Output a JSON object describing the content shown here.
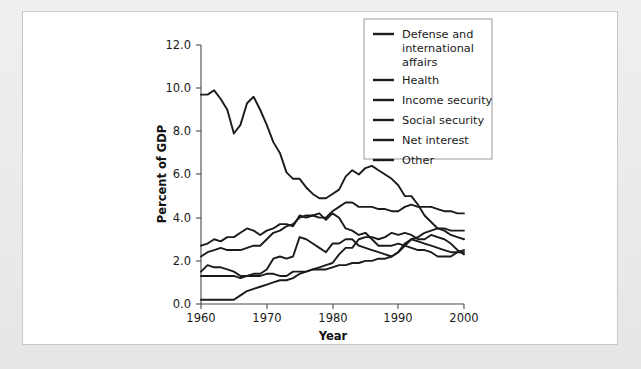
{
  "chart_data": {
    "type": "line",
    "title": "",
    "xlabel": "Year",
    "ylabel": "Percent of GDP",
    "xlim": [
      1960,
      2000
    ],
    "ylim": [
      0.0,
      12.0
    ],
    "grid": false,
    "legend_position": "top-right",
    "xticks": [
      1960,
      1970,
      1980,
      1990,
      2000
    ],
    "xtick_labels": [
      "1960",
      "1970",
      "1980",
      "1990",
      "2000"
    ],
    "yticks": [
      0.0,
      2.0,
      4.0,
      6.0,
      8.0,
      10.0,
      12.0
    ],
    "ytick_labels": [
      "0.0",
      "2.0",
      "4.0",
      "6.0",
      "8.0",
      "10.0",
      "12.0"
    ],
    "x": [
      1960,
      1961,
      1962,
      1963,
      1964,
      1965,
      1966,
      1967,
      1968,
      1969,
      1970,
      1971,
      1972,
      1973,
      1974,
      1975,
      1976,
      1977,
      1978,
      1979,
      1980,
      1981,
      1982,
      1983,
      1984,
      1985,
      1986,
      1987,
      1988,
      1989,
      1990,
      1991,
      1992,
      1993,
      1994,
      1995,
      1996,
      1997,
      1998,
      1999,
      2000
    ],
    "series": [
      {
        "name": "Defense and international affairs",
        "color": "#1b1b1b",
        "values": [
          9.7,
          9.7,
          9.9,
          9.5,
          9.0,
          7.9,
          8.3,
          9.3,
          9.6,
          9.0,
          8.3,
          7.5,
          7.0,
          6.1,
          5.8,
          5.8,
          5.4,
          5.1,
          4.9,
          4.9,
          5.1,
          5.3,
          5.9,
          6.2,
          6.0,
          6.3,
          6.4,
          6.2,
          6.0,
          5.8,
          5.5,
          5.0,
          5.0,
          4.6,
          4.1,
          3.8,
          3.5,
          3.4,
          3.2,
          3.1,
          3.0
        ]
      },
      {
        "name": "Health",
        "color": "#1b1b1b",
        "values": [
          0.2,
          0.2,
          0.2,
          0.2,
          0.2,
          0.2,
          0.4,
          0.6,
          0.7,
          0.8,
          0.9,
          1.0,
          1.1,
          1.1,
          1.2,
          1.4,
          1.5,
          1.6,
          1.6,
          1.6,
          1.7,
          1.8,
          1.8,
          1.9,
          1.9,
          2.0,
          2.0,
          2.1,
          2.1,
          2.2,
          2.4,
          2.7,
          3.0,
          3.1,
          3.3,
          3.4,
          3.5,
          3.5,
          3.4,
          3.4,
          3.4
        ]
      },
      {
        "name": "Income security",
        "color": "#1b1b1b",
        "values": [
          1.5,
          1.8,
          1.7,
          1.7,
          1.6,
          1.5,
          1.3,
          1.3,
          1.4,
          1.4,
          1.6,
          2.1,
          2.2,
          2.1,
          2.2,
          3.1,
          3.0,
          2.8,
          2.6,
          2.4,
          2.8,
          2.8,
          3.0,
          3.0,
          2.7,
          2.6,
          2.5,
          2.4,
          2.3,
          2.2,
          2.4,
          2.8,
          3.0,
          2.9,
          2.8,
          2.7,
          2.6,
          2.5,
          2.4,
          2.4,
          2.5
        ]
      },
      {
        "name": "Social security",
        "color": "#1b1b1b",
        "values": [
          2.2,
          2.4,
          2.5,
          2.6,
          2.5,
          2.5,
          2.5,
          2.6,
          2.7,
          2.7,
          3.0,
          3.3,
          3.4,
          3.6,
          3.7,
          4.0,
          4.1,
          4.1,
          4.0,
          4.0,
          4.3,
          4.5,
          4.7,
          4.7,
          4.5,
          4.5,
          4.5,
          4.4,
          4.4,
          4.3,
          4.3,
          4.5,
          4.6,
          4.5,
          4.5,
          4.5,
          4.4,
          4.3,
          4.3,
          4.2,
          4.2
        ]
      },
      {
        "name": "Net interest",
        "color": "#1b1b1b",
        "values": [
          1.3,
          1.3,
          1.3,
          1.3,
          1.3,
          1.3,
          1.2,
          1.3,
          1.3,
          1.3,
          1.4,
          1.4,
          1.3,
          1.3,
          1.5,
          1.5,
          1.5,
          1.6,
          1.7,
          1.8,
          1.9,
          2.3,
          2.6,
          2.6,
          3.0,
          3.1,
          3.1,
          3.0,
          3.1,
          3.3,
          3.2,
          3.3,
          3.2,
          3.0,
          3.0,
          3.2,
          3.1,
          3.0,
          2.8,
          2.5,
          2.3
        ]
      },
      {
        "name": "Other",
        "color": "#1b1b1b",
        "values": [
          2.7,
          2.8,
          3.0,
          2.9,
          3.1,
          3.1,
          3.3,
          3.5,
          3.4,
          3.2,
          3.4,
          3.5,
          3.7,
          3.7,
          3.6,
          4.1,
          4.0,
          4.1,
          4.2,
          3.9,
          4.2,
          4.0,
          3.5,
          3.4,
          3.2,
          3.3,
          3.0,
          2.7,
          2.7,
          2.7,
          2.8,
          2.7,
          2.6,
          2.5,
          2.5,
          2.4,
          2.2,
          2.2,
          2.2,
          2.4,
          2.4
        ]
      }
    ],
    "legend": [
      {
        "label": "Defense and",
        "label2": "international",
        "label3": "affairs"
      },
      {
        "label": "Health"
      },
      {
        "label": "Income security"
      },
      {
        "label": "Social security"
      },
      {
        "label": "Net interest"
      },
      {
        "label": "Other"
      }
    ]
  },
  "legend_entries": {
    "e0_l1": "Defense and",
    "e0_l2": "international",
    "e0_l3": "affairs",
    "e1": "Health",
    "e2": "Income security",
    "e3": "Social security",
    "e4": "Net interest",
    "e5": "Other"
  },
  "axes": {
    "ylabel": "Percent of GDP",
    "xlabel": "Year",
    "ytick_0": "0.0",
    "ytick_1": "2.0",
    "ytick_2": "4.0",
    "ytick_3": "6.0",
    "ytick_4": "8.0",
    "ytick_5": "10.0",
    "ytick_6": "12.0",
    "xtick_0": "1960",
    "xtick_1": "1970",
    "xtick_2": "1980",
    "xtick_3": "1990",
    "xtick_4": "2000"
  }
}
